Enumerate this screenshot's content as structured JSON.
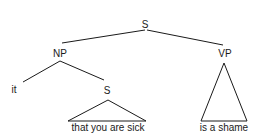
{
  "tree": {
    "root": {
      "label": "S"
    },
    "np": {
      "label": "NP"
    },
    "vp": {
      "label": "VP"
    },
    "it": {
      "label": "it"
    },
    "embedded_s": {
      "label": "S"
    },
    "embedded_s_yield": {
      "label": "that you are sick"
    },
    "vp_yield": {
      "label": "is a shame"
    }
  }
}
